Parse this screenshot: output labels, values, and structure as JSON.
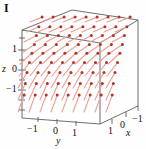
{
  "figure": {
    "panel_label": "I",
    "type": "3d-vector-field",
    "box_color": "#4a4a4a",
    "arrow_shaft_color": "#e8a398",
    "arrow_head_color": "#b23226"
  },
  "axes": {
    "z": {
      "name": "z",
      "ticks": [
        "1",
        "0",
        "−1"
      ]
    },
    "y": {
      "name": "y",
      "ticks": [
        "−1",
        "0",
        "1"
      ]
    },
    "x": {
      "name": "x",
      "ticks": [
        "1",
        "0",
        "−1"
      ]
    }
  },
  "chart_data": {
    "type": "scatter",
    "title": "I",
    "xlabel": "x",
    "ylabel": "y",
    "zlabel": "z",
    "xlim": [
      -1.5,
      1.5
    ],
    "ylim": [
      -1.5,
      1.5
    ],
    "zlim": [
      -1.5,
      1.5
    ],
    "xticks": [
      1,
      0,
      -1
    ],
    "yticks": [
      -1,
      0,
      1
    ],
    "zticks": [
      1,
      0,
      -1
    ],
    "grid": false,
    "legend": "none",
    "field_rows": [
      {
        "row": 0,
        "screen_y": 22,
        "slope_deg": -22,
        "length": 13,
        "count": 9,
        "x_start": 30,
        "x_step": 11
      },
      {
        "row": 1,
        "screen_y": 32,
        "slope_deg": -24,
        "length": 13,
        "count": 9,
        "x_start": 27,
        "x_step": 11
      },
      {
        "row": 2,
        "screen_y": 42,
        "slope_deg": -28,
        "length": 14,
        "count": 9,
        "x_start": 24,
        "x_step": 11
      },
      {
        "row": 3,
        "screen_y": 53,
        "slope_deg": -34,
        "length": 15,
        "count": 9,
        "x_start": 22,
        "x_step": 11
      },
      {
        "row": 4,
        "screen_y": 64,
        "slope_deg": -42,
        "length": 16,
        "count": 9,
        "x_start": 20,
        "x_step": 11
      },
      {
        "row": 5,
        "screen_y": 76,
        "slope_deg": -52,
        "length": 17,
        "count": 9,
        "x_start": 19,
        "x_step": 11
      },
      {
        "row": 6,
        "screen_y": 88,
        "slope_deg": -60,
        "length": 18,
        "count": 9,
        "x_start": 18,
        "x_step": 11
      },
      {
        "row": 7,
        "screen_y": 100,
        "slope_deg": -66,
        "length": 18,
        "count": 9,
        "x_start": 18,
        "x_step": 11
      },
      {
        "row": 8,
        "screen_y": 112,
        "slope_deg": -70,
        "length": 18,
        "count": 9,
        "x_start": 18,
        "x_step": 11
      }
    ]
  }
}
